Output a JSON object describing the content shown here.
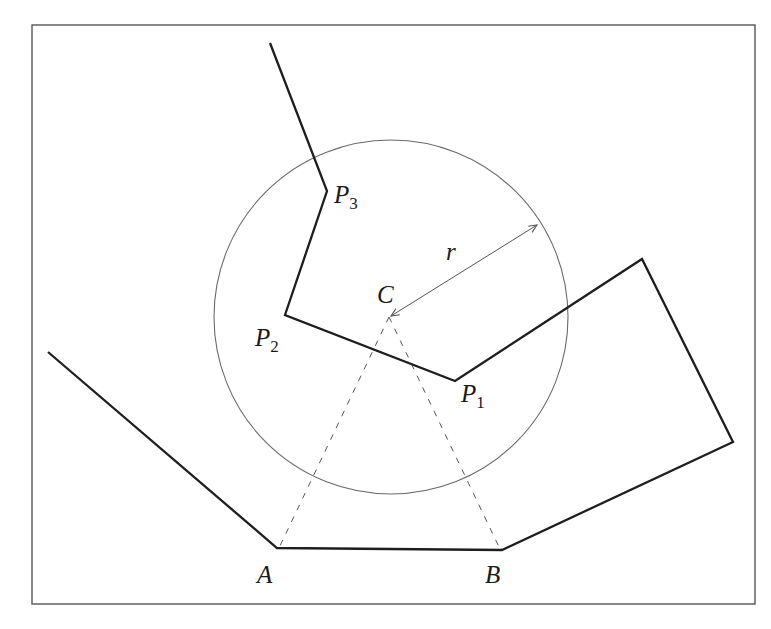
{
  "diagram": {
    "frame": {
      "x": 32,
      "y": 25,
      "width": 723,
      "height": 579
    },
    "circle": {
      "center_label": "C",
      "cx": 391,
      "cy": 317,
      "r": 177,
      "radius_label": "r"
    },
    "labels": {
      "C": "C",
      "r": "r",
      "A": "A",
      "B": "B",
      "P1": {
        "base": "P",
        "sub": "1"
      },
      "P2": {
        "base": "P",
        "sub": "2"
      },
      "P3": {
        "base": "P",
        "sub": "3"
      }
    },
    "points": {
      "A": [
        277,
        548
      ],
      "B": [
        502,
        550
      ],
      "P1": [
        455,
        381
      ],
      "P2": [
        285,
        315
      ],
      "P3": [
        327,
        191
      ],
      "C": [
        389,
        317
      ]
    },
    "polylines": {
      "left_chain": [
        [
          48,
          352
        ],
        [
          277,
          548
        ],
        [
          502,
          550
        ],
        [
          733,
          442
        ],
        [
          642,
          259
        ],
        [
          455,
          381
        ],
        [
          285,
          315
        ],
        [
          327,
          191
        ],
        [
          270,
          43
        ]
      ]
    },
    "dashed_lines": [
      {
        "from": "C",
        "to": "A"
      },
      {
        "from": "C",
        "to": "B"
      }
    ],
    "colors": {
      "stroke": "#1e1e1e",
      "circle": "#6a6a6a",
      "frame": "#555555",
      "background": "#ffffff"
    }
  }
}
